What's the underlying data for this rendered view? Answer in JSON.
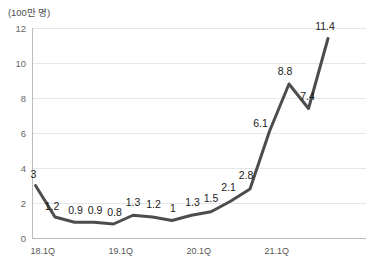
{
  "chart_data": {
    "type": "line",
    "title": "",
    "subtitle": "",
    "unit_label": "(100만 명)",
    "xlabel": "",
    "ylabel": "",
    "ylim": [
      0,
      12
    ],
    "ytick_values": [
      0,
      2,
      4,
      6,
      8,
      10,
      12
    ],
    "ytick_labels": [
      "0",
      "2",
      "4",
      "6",
      "8",
      "10",
      "12"
    ],
    "xtick_labels": [
      "18.1Q",
      "19.1Q",
      "20.1Q",
      "21.1Q"
    ],
    "xtick_indices": [
      0,
      4,
      8,
      12
    ],
    "grid": true,
    "legend_position": "none",
    "categories": [
      "18.1Q",
      "18.2Q",
      "18.3Q",
      "18.4Q",
      "19.1Q",
      "19.2Q",
      "19.3Q",
      "19.4Q",
      "20.1Q",
      "20.2Q",
      "20.3Q",
      "20.4Q",
      "21.1Q",
      "21.2Q",
      "21.3Q",
      "21.4Q"
    ],
    "values": [
      3,
      1.2,
      0.9,
      0.9,
      0.8,
      1.3,
      1.2,
      1,
      1.3,
      1.5,
      2.1,
      2.8,
      6.1,
      8.8,
      7.4,
      11.4
    ],
    "data_labels": [
      "3",
      "1.2",
      "0.9",
      "0.9",
      "0.8",
      "1.3",
      "1.2",
      "1",
      "1.3",
      "1.5",
      "2.1",
      "2.8",
      "6.1",
      "8.8",
      "7.4",
      "11.4"
    ],
    "series": [
      {
        "name": "",
        "values": [
          3,
          1.2,
          0.9,
          0.9,
          0.8,
          1.3,
          1.2,
          1,
          1.3,
          1.5,
          2.1,
          2.8,
          6.1,
          8.8,
          7.4,
          11.4
        ],
        "color": "#4d4d4d"
      }
    ],
    "colors": {
      "line": "#4d4d4d",
      "gridline": "#e4e6e8",
      "axis": "#b9bcbe",
      "label_text": "#1a1a1a",
      "tick_text": "#666666",
      "background": "#ffffff"
    }
  },
  "source_note": ""
}
